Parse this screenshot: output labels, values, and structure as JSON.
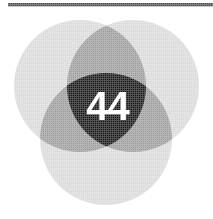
{
  "figure": {
    "type": "venn-diagram",
    "set_count": 3,
    "center_label": "44",
    "background_color": "#ffffff"
  },
  "rule": {
    "color": "#4a4a4a"
  },
  "colors": {
    "single_region": "#d9d9d9",
    "pair_overlap": "#9a9a9a",
    "triple_overlap": "#111111",
    "center_text": "#ffffff",
    "rule": "#4a4a4a"
  },
  "chart_data": {
    "type": "venn",
    "title": "",
    "sets": [
      {
        "name": "set-upper-left",
        "cx": 80,
        "cy": 86,
        "r": 66,
        "fill": "#d9d9d9"
      },
      {
        "name": "set-upper-right",
        "cx": 133,
        "cy": 86,
        "r": 66,
        "fill": "#d9d9d9"
      },
      {
        "name": "set-bottom",
        "cx": 106,
        "cy": 139,
        "r": 66,
        "fill": "#d9d9d9"
      }
    ],
    "regions": [
      {
        "name": "upper-left-only",
        "value": null,
        "label": "",
        "fill": "#d9d9d9"
      },
      {
        "name": "upper-right-only",
        "value": null,
        "label": "",
        "fill": "#d9d9d9"
      },
      {
        "name": "bottom-only",
        "value": null,
        "label": "",
        "fill": "#d9d9d9"
      },
      {
        "name": "upper-left-upper-right",
        "value": null,
        "label": "",
        "fill": "#9a9a9a"
      },
      {
        "name": "upper-left-bottom",
        "value": null,
        "label": "",
        "fill": "#9a9a9a"
      },
      {
        "name": "upper-right-bottom",
        "value": null,
        "label": "",
        "fill": "#9a9a9a"
      },
      {
        "name": "all-three",
        "value": 44,
        "label": "44",
        "fill": "#111111"
      }
    ],
    "legend": [],
    "annotations": [
      {
        "text": "44",
        "region": "all-three",
        "color": "#ffffff"
      }
    ]
  }
}
